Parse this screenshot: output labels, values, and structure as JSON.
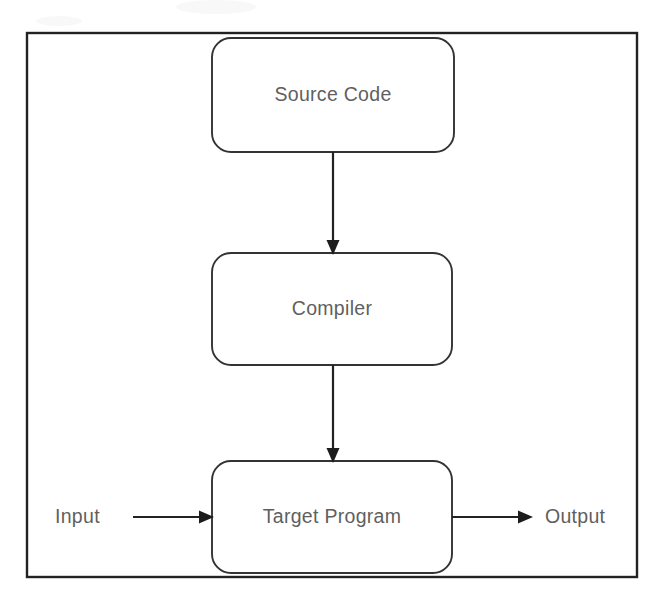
{
  "diagram": {
    "frame": {
      "x": 27,
      "y": 33,
      "width": 610,
      "height": 544
    },
    "colors": {
      "background": "#ffffff",
      "frame_stroke": "#222222",
      "node_stroke": "#333333",
      "node_fill": "#ffffff",
      "label_text": "#5f5f5f",
      "arrow_fill": "#1c1c1c"
    },
    "nodes": [
      {
        "id": "source-code",
        "label": "Source Code",
        "x": 212,
        "y": 38,
        "width": 242,
        "height": 114,
        "corner_radius": 19
      },
      {
        "id": "compiler",
        "label": "Compiler",
        "x": 212,
        "y": 253,
        "width": 240,
        "height": 112,
        "corner_radius": 19
      },
      {
        "id": "target-program",
        "label": "Target Program",
        "x": 212,
        "y": 461,
        "width": 240,
        "height": 112,
        "corner_radius": 19
      }
    ],
    "io_labels": [
      {
        "id": "input",
        "label": "Input",
        "x": 55,
        "y": 518
      },
      {
        "id": "output",
        "label": "Output",
        "x": 545,
        "y": 518
      }
    ],
    "connectors": [
      {
        "id": "source-to-compiler",
        "from": "source-code",
        "to": "compiler",
        "orientation": "vertical",
        "x1": 333,
        "y1": 152,
        "x2": 333,
        "y2": 253
      },
      {
        "id": "compiler-to-target",
        "from": "compiler",
        "to": "target-program",
        "orientation": "vertical",
        "x1": 333,
        "y1": 365,
        "x2": 333,
        "y2": 461
      },
      {
        "id": "input-to-target",
        "from": "input",
        "to": "target-program",
        "orientation": "horizontal",
        "x1": 133,
        "y1": 517,
        "x2": 212,
        "y2": 517
      },
      {
        "id": "target-to-output",
        "from": "target-program",
        "to": "output",
        "orientation": "horizontal",
        "x1": 452,
        "y1": 517,
        "x2": 531,
        "y2": 517
      }
    ]
  }
}
